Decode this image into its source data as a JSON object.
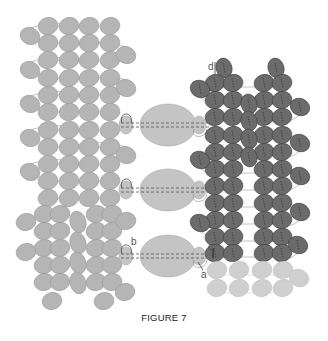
{
  "figure": {
    "caption": "FIGURE 7",
    "colors": {
      "light_bead": "#b5b5b5",
      "light_bead_stroke": "#9a9a9a",
      "faded_bead": "#cfcfcf",
      "dark_bead": "#6b6b6b",
      "dark_bead_stroke": "#3e3e3e",
      "thread": "#9a9a9a",
      "dark_thread": "#333333",
      "center_bead": "#c4c4c4",
      "center_bead_stroke": "#a8a8a8"
    },
    "labels": [
      {
        "text": "d",
        "x": 208,
        "y": 70
      },
      {
        "text": "b",
        "x": 131,
        "y": 245
      },
      {
        "text": "c",
        "x": 208,
        "y": 250
      },
      {
        "text": "a",
        "x": 201,
        "y": 278
      }
    ],
    "center_beads": [
      {
        "cx": 168,
        "cy": 125,
        "rx": 28,
        "ry": 21
      },
      {
        "cx": 168,
        "cy": 190,
        "rx": 28,
        "ry": 21
      },
      {
        "cx": 168,
        "cy": 256,
        "rx": 28,
        "ry": 21
      }
    ],
    "connector_beads": [
      {
        "cx": 126,
        "cy": 125
      },
      {
        "cx": 199,
        "cy": 125
      },
      {
        "cx": 126,
        "cy": 190
      },
      {
        "cx": 199,
        "cy": 190
      },
      {
        "cx": 126,
        "cy": 256
      },
      {
        "cx": 199,
        "cy": 256
      }
    ],
    "left_panel": {
      "columns_x": [
        48,
        69,
        89,
        110
      ],
      "rows_y": [
        26,
        43,
        60,
        78,
        95,
        112,
        130,
        147,
        164,
        181,
        198
      ],
      "side_beads": [
        {
          "cx": 30,
          "cy": 36
        },
        {
          "cx": 126,
          "cy": 55
        },
        {
          "cx": 30,
          "cy": 70
        },
        {
          "cx": 126,
          "cy": 88
        },
        {
          "cx": 30,
          "cy": 104
        },
        {
          "cx": 126,
          "cy": 155
        },
        {
          "cx": 30,
          "cy": 138
        },
        {
          "cx": 30,
          "cy": 172
        }
      ],
      "lower_section": [
        {
          "cx": 44,
          "cy": 214
        },
        {
          "cx": 60,
          "cy": 214
        },
        {
          "cx": 96,
          "cy": 214
        },
        {
          "cx": 112,
          "cy": 214
        },
        {
          "cx": 44,
          "cy": 231
        },
        {
          "cx": 60,
          "cy": 231
        },
        {
          "cx": 96,
          "cy": 231
        },
        {
          "cx": 112,
          "cy": 231
        },
        {
          "cx": 44,
          "cy": 248
        },
        {
          "cx": 60,
          "cy": 248
        },
        {
          "cx": 96,
          "cy": 248
        },
        {
          "cx": 112,
          "cy": 248
        },
        {
          "cx": 44,
          "cy": 265
        },
        {
          "cx": 60,
          "cy": 265
        },
        {
          "cx": 96,
          "cy": 265
        },
        {
          "cx": 112,
          "cy": 265
        },
        {
          "cx": 44,
          "cy": 282
        },
        {
          "cx": 60,
          "cy": 282
        },
        {
          "cx": 96,
          "cy": 282
        },
        {
          "cx": 112,
          "cy": 282
        },
        {
          "cx": 52,
          "cy": 301
        },
        {
          "cx": 104,
          "cy": 301
        },
        {
          "cx": 78,
          "cy": 222,
          "vertical": true
        },
        {
          "cx": 78,
          "cy": 243,
          "vertical": true
        },
        {
          "cx": 78,
          "cy": 263,
          "vertical": true
        },
        {
          "cx": 78,
          "cy": 283,
          "vertical": true
        },
        {
          "cx": 26,
          "cy": 222
        },
        {
          "cx": 126,
          "cy": 221
        },
        {
          "cx": 26,
          "cy": 252
        },
        {
          "cx": 125,
          "cy": 292
        }
      ]
    },
    "right_panel": {
      "top_beads": [
        {
          "cx": 224,
          "cy": 68
        },
        {
          "cx": 276,
          "cy": 68
        }
      ],
      "columns_x": [
        215,
        233,
        264,
        282
      ],
      "rows_y": [
        83,
        100,
        117,
        135,
        152,
        169,
        186,
        203,
        220,
        237,
        253
      ],
      "middle_column": [
        {
          "cx": 249,
          "cy": 104
        },
        {
          "cx": 249,
          "cy": 121
        },
        {
          "cx": 249,
          "cy": 139
        },
        {
          "cx": 249,
          "cy": 157
        }
      ],
      "side_beads": [
        {
          "cx": 200,
          "cy": 89
        },
        {
          "cx": 300,
          "cy": 107
        },
        {
          "cx": 300,
          "cy": 143
        },
        {
          "cx": 200,
          "cy": 160
        },
        {
          "cx": 300,
          "cy": 176
        },
        {
          "cx": 200,
          "cy": 223
        },
        {
          "cx": 300,
          "cy": 212
        },
        {
          "cx": 298,
          "cy": 245
        }
      ],
      "faded_rows": {
        "columns_x": [
          217,
          239,
          262,
          283
        ],
        "rows_y": [
          270,
          288
        ],
        "extra": [
          {
            "cx": 299,
            "cy": 278
          }
        ]
      }
    }
  }
}
